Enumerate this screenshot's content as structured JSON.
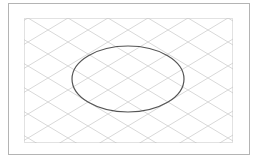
{
  "canvas": {
    "width": 258,
    "height": 158,
    "background": "#ffffff"
  },
  "outer_frame": {
    "x": 8,
    "y": 3,
    "width": 241,
    "height": 151,
    "stroke": "#b4b4b4"
  },
  "inner_area": {
    "x": 24,
    "y": 18,
    "width": 208,
    "height": 124,
    "stroke": "#c4c4c4",
    "dash": "1,1"
  },
  "grid": {
    "type": "diamond-lattice",
    "origin_x": 28,
    "origin_y": 18,
    "spacing_x": 40,
    "slope": 0.6,
    "stroke": "#cfcfcf"
  },
  "ellipse": {
    "cx": 128,
    "cy": 79,
    "rx": 56,
    "ry": 33,
    "stroke": "#555555",
    "stroke_width": 1.2
  }
}
